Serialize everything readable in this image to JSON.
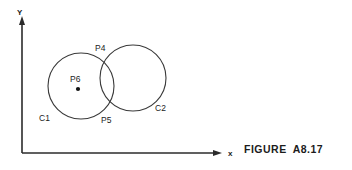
{
  "figure": {
    "caption_word": "FIGURE",
    "caption_number": "A8.17",
    "type": "geometry-diagram"
  },
  "axes": {
    "x_label": "x",
    "y_label": "Y",
    "origin": {
      "x": 22,
      "y": 153
    },
    "x_end": {
      "x": 222,
      "y": 153
    },
    "y_end": {
      "x": 22,
      "y": 18
    },
    "color": "#2b2b2b"
  },
  "shapes": {
    "circles": [
      {
        "id": "C1",
        "label": "C1",
        "cx": 81,
        "cy": 86,
        "r": 33,
        "label_x": 39,
        "label_y": 121,
        "stroke": "#3a3a3a"
      },
      {
        "id": "C2",
        "label": "C2",
        "cx": 133,
        "cy": 78,
        "r": 33,
        "label_x": 155,
        "label_y": 111,
        "stroke": "#3a3a3a"
      }
    ],
    "points": [
      {
        "id": "P4",
        "label": "P4",
        "x": 108,
        "y": 72,
        "label_x": 95,
        "label_y": 51,
        "dot_visible": false
      },
      {
        "id": "P5",
        "label": "P5",
        "x": 108,
        "y": 110,
        "label_x": 101,
        "label_y": 123,
        "dot_visible": false
      },
      {
        "id": "P6",
        "label": "P6",
        "x": 78,
        "y": 89,
        "label_x": 70,
        "label_y": 82,
        "dot_visible": true,
        "dot_r": 2.1
      }
    ]
  },
  "colors": {
    "ink": "#1c1c1c",
    "stroke": "#3a3a3a",
    "axis": "#2b2b2b",
    "background": "#ffffff"
  }
}
